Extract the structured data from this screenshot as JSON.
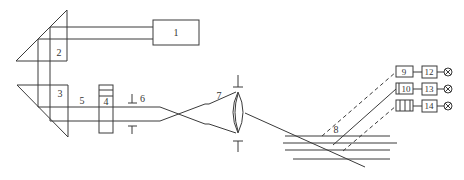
{
  "diagram": {
    "type": "optical-schematic",
    "labels": {
      "l1": "1",
      "l2": "2",
      "l3": "3",
      "l4": "4",
      "l5": "5",
      "l6": "6",
      "l7": "7",
      "l8": "8",
      "l9": "9",
      "l10": "10",
      "l11": "",
      "l12": "12",
      "l13": "13",
      "l14": "14"
    },
    "detector_symbol": "⊗",
    "colors": {
      "stroke": "#3a3a3a",
      "background": "#ffffff"
    }
  }
}
